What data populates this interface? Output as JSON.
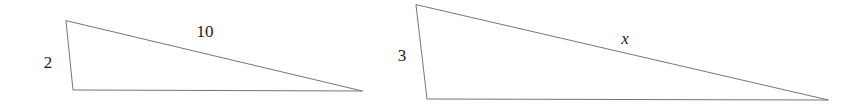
{
  "canvas": {
    "width": 861,
    "height": 106,
    "background_color": "#ffffff",
    "stroke_color": "#767676",
    "text_color": "#1a1a1a",
    "stroke_width": 1
  },
  "figures": [
    {
      "id": "left-triangle",
      "name": "left-triangle",
      "vertices": {
        "apex": [
          66,
          21
        ],
        "bottom_left": [
          73,
          90
        ],
        "right_tip": [
          362,
          91
        ]
      },
      "labels": {
        "leg": "2",
        "hypotenuse": "10"
      }
    },
    {
      "id": "right-triangle",
      "name": "right-triangle",
      "vertices": {
        "apex": [
          416,
          5
        ],
        "bottom_left": [
          427,
          99
        ],
        "right_tip": [
          828,
          100
        ]
      },
      "labels": {
        "leg": "3",
        "hypotenuse": "x"
      }
    }
  ],
  "chart_data": {
    "type": "diagram",
    "title": "",
    "subtitle": "",
    "shapes": [
      {
        "name": "left-triangle",
        "type": "triangle",
        "points": [
          [
            66,
            21
          ],
          [
            73,
            90
          ],
          [
            362,
            91
          ]
        ],
        "fill": "none",
        "stroke": "#767676"
      },
      {
        "name": "right-triangle",
        "type": "triangle",
        "points": [
          [
            416,
            5
          ],
          [
            427,
            99
          ],
          [
            828,
            100
          ]
        ],
        "fill": "none",
        "stroke": "#767676"
      }
    ],
    "annotations": [
      {
        "text": "2",
        "x": 48,
        "y": 62,
        "style": "roman",
        "attached_to": "left-triangle-left-side"
      },
      {
        "text": "10",
        "x": 205,
        "y": 31,
        "style": "roman",
        "attached_to": "left-triangle-upper-side"
      },
      {
        "text": "3",
        "x": 402,
        "y": 55,
        "style": "roman",
        "attached_to": "right-triangle-left-side"
      },
      {
        "text": "x",
        "x": 625,
        "y": 38,
        "style": "italic",
        "attached_to": "right-triangle-upper-side"
      }
    ]
  }
}
